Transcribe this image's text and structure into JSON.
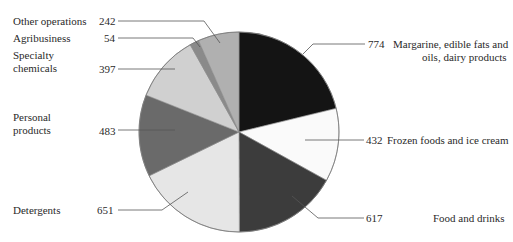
{
  "chart_data": {
    "type": "pie",
    "title": "",
    "slices": [
      {
        "label": "Margarine, edible fats and oils, dairy products",
        "value": 774,
        "color": "#141414"
      },
      {
        "label": "Frozen foods and ice cream",
        "value": 432,
        "color": "#fafafa"
      },
      {
        "label": "Food and drinks",
        "value": 617,
        "color": "#3c3c3c"
      },
      {
        "label": "Detergents",
        "value": 651,
        "color": "#e6e6e6"
      },
      {
        "label": "Personal products",
        "value": 483,
        "color": "#6a6a6a"
      },
      {
        "label": "Specialty chemicals",
        "value": 397,
        "color": "#d0d0d0"
      },
      {
        "label": "Agribusiness",
        "value": 54,
        "color": "#8a8a8a"
      },
      {
        "label": "Other operations",
        "value": 242,
        "color": "#b0b0b0"
      }
    ],
    "start_angle_deg": 0,
    "direction": "clockwise",
    "legend": "none (direct labels with leader lines)"
  },
  "labels": {
    "margarine_line1": "Margarine, edible fats and",
    "margarine_line2": "oils, dairy products",
    "margarine_value": "774",
    "frozen": "Frozen foods and ice cream",
    "frozen_value": "432",
    "food": "Food and drinks",
    "food_value": "617",
    "detergents": "Detergents",
    "detergents_value": "651",
    "personal_line1": "Personal",
    "personal_line2": "products",
    "personal_value": "483",
    "specialty_line1": "Specialty",
    "specialty_line2": "chemicals",
    "specialty_value": "397",
    "agri": "Agribusiness",
    "agri_value": "54",
    "other": "Other operations",
    "other_value": "242"
  }
}
